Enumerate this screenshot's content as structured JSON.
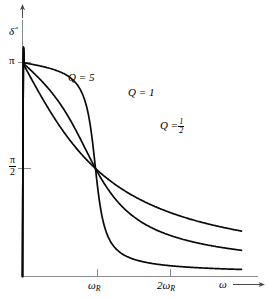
{
  "figure": {
    "background_color": "#ffffff",
    "ink_color": "#000000",
    "axis_color": "#8c8c8c"
  },
  "axes": {
    "y_label": "δ̂",
    "y_label_base": "δ",
    "x_label": "ω",
    "y_ticks": [
      {
        "label": "π",
        "value": 3.14159,
        "kind": "plain"
      },
      {
        "label": "π/2",
        "numerator": "π",
        "denominator": "2",
        "value": 1.5708,
        "kind": "fraction"
      }
    ],
    "x_ticks": [
      {
        "label": "ω_R",
        "base": "ω",
        "sub": "R",
        "value": 1
      },
      {
        "label": "2ω_R",
        "prefix": "2",
        "base": "ω",
        "sub": "R",
        "value": 2
      }
    ],
    "x_arrow": true,
    "y_arrow": true
  },
  "annotations": [
    {
      "id": "q5",
      "text": "Q = 5",
      "q_symbol": "Q",
      "equals": "=",
      "value": "5"
    },
    {
      "id": "q1",
      "text": "Q = 1",
      "q_symbol": "Q",
      "equals": "=",
      "value": "1"
    },
    {
      "id": "qhalf",
      "text": "Q = 1/2",
      "q_symbol": "Q",
      "equals": "=",
      "value": "1/2",
      "numerator": "1",
      "denominator": "2"
    }
  ],
  "chart_data": {
    "type": "line",
    "title": "",
    "subtitle": "",
    "xlabel": "ω",
    "ylabel": "δ̂",
    "xlim": [
      0,
      3.1
    ],
    "ylim": [
      0,
      3.6
    ],
    "grid": false,
    "legend": "inline-curve-labels",
    "x_tick_labels": [
      "ω_R",
      "2ω_R"
    ],
    "x_tick_values": [
      1,
      2
    ],
    "y_tick_labels": [
      "π/2",
      "π"
    ],
    "y_tick_values": [
      1.5708,
      3.14159
    ],
    "note": "Phase angle delta-hat versus driving frequency omega for a resonant system; all curves pass through (omega_R, pi/2) and asymptote to pi.",
    "series": [
      {
        "name": "Q = 5",
        "q": 5,
        "x": [
          0,
          0.1,
          0.2,
          0.3,
          0.4,
          0.5,
          0.6,
          0.7,
          0.75,
          0.8,
          0.85,
          0.9,
          0.95,
          1.0,
          1.05,
          1.1,
          1.15,
          1.2,
          1.3,
          1.4,
          1.5,
          1.6,
          1.8,
          2.0,
          2.2,
          2.5,
          2.8,
          3.1
        ],
        "y": [
          0,
          0.051,
          0.104,
          0.163,
          0.231,
          0.318,
          0.442,
          0.657,
          0.822,
          1.043,
          1.317,
          1.607,
          1.865,
          1.5708,
          2.268,
          2.437,
          2.561,
          2.653,
          2.781,
          2.862,
          2.917,
          2.957,
          3.008,
          3.038,
          3.058,
          3.078,
          3.09,
          3.098
        ]
      },
      {
        "name": "Q = 1",
        "q": 1,
        "x": [
          0,
          0.1,
          0.2,
          0.3,
          0.4,
          0.5,
          0.6,
          0.7,
          0.8,
          0.9,
          1.0,
          1.1,
          1.2,
          1.3,
          1.4,
          1.5,
          1.6,
          1.8,
          2.0,
          2.2,
          2.5,
          2.8,
          3.1
        ],
        "y": [
          0,
          0.101,
          0.207,
          0.324,
          0.456,
          0.608,
          0.786,
          0.989,
          1.207,
          1.402,
          1.5708,
          1.808,
          1.982,
          2.119,
          2.229,
          2.318,
          2.393,
          2.509,
          2.594,
          2.659,
          2.733,
          2.786,
          2.827
        ]
      },
      {
        "name": "Q = 1/2",
        "q": 0.5,
        "x": [
          0,
          0.1,
          0.2,
          0.3,
          0.4,
          0.5,
          0.6,
          0.7,
          0.8,
          0.9,
          1.0,
          1.1,
          1.2,
          1.3,
          1.4,
          1.5,
          1.6,
          1.8,
          2.0,
          2.2,
          2.5,
          2.8,
          3.1
        ],
        "y": [
          0,
          0.202,
          0.399,
          0.588,
          0.765,
          0.927,
          1.073,
          1.203,
          1.318,
          1.449,
          1.5708,
          1.693,
          1.784,
          1.866,
          1.939,
          2.004,
          2.062,
          2.16,
          2.241,
          2.308,
          2.39,
          2.454,
          2.505
        ]
      }
    ]
  }
}
